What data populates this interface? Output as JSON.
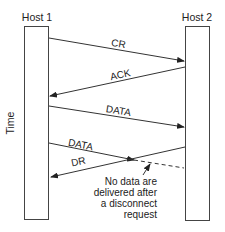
{
  "hosts": [
    {
      "label": "Host 1"
    },
    {
      "label": "Host 2"
    }
  ],
  "axis": {
    "label": "Time"
  },
  "messages": [
    {
      "label": "CR",
      "direction": "host1-to-host2"
    },
    {
      "label": "ACK",
      "direction": "host2-to-host1"
    },
    {
      "label": "DATA",
      "direction": "host1-to-host2"
    },
    {
      "label": "DATA",
      "direction": "host1-to-host2",
      "note": "lost after disconnect"
    },
    {
      "label": "DR",
      "direction": "host2-to-host1"
    }
  ],
  "annotation": {
    "lines": [
      "No data are",
      "delivered after",
      "a disconnect",
      "request"
    ]
  },
  "colors": {
    "stroke": "#333333",
    "text": "#222222"
  }
}
